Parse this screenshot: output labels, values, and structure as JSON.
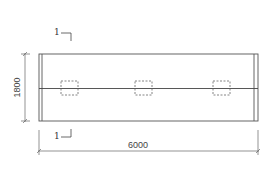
{
  "drawing": {
    "type": "plan-view",
    "dimensions": {
      "width_label": "6000",
      "height_label": "1800"
    },
    "section_markers": [
      {
        "label": "1",
        "position": "top"
      },
      {
        "label": "1",
        "position": "bottom"
      }
    ],
    "openings_count": 3,
    "colors": {
      "line": "#555555",
      "background": "#ffffff"
    }
  }
}
